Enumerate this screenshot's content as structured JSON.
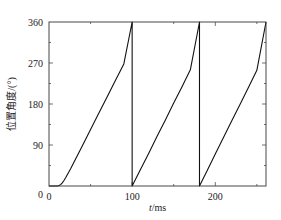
{
  "chart_data": {
    "type": "line",
    "title": "",
    "xlabel_italic": "t",
    "xlabel_unit": "/ms",
    "ylabel": "位置角度/(°)",
    "xlim": [
      0,
      261
    ],
    "ylim": [
      0,
      360
    ],
    "xticks": [
      0,
      100,
      200
    ],
    "xtick_labels": [
      "0",
      "100",
      "200"
    ],
    "x_minor_ticks": [
      50,
      150,
      250
    ],
    "yticks": [
      0,
      90,
      180,
      270,
      360
    ],
    "ytick_labels": [
      "0",
      "90",
      "180",
      "270",
      "360"
    ],
    "y_minor_ticks": [
      45,
      135,
      225,
      315
    ],
    "grid": false,
    "legend": "none",
    "series": [
      {
        "name": "position-angle",
        "color": "#111111",
        "x": [
          0,
          10,
          12,
          14,
          16,
          18,
          20,
          23,
          26,
          30,
          40,
          50,
          60,
          70,
          80,
          90,
          100,
          100,
          110,
          120,
          130,
          140,
          150,
          160,
          170,
          181,
          181,
          190,
          200,
          210,
          220,
          230,
          240,
          250,
          261
        ],
        "y": [
          0,
          0,
          1,
          3,
          7,
          12,
          18,
          28,
          38,
          52,
          88,
          124,
          160,
          196,
          232,
          268,
          360,
          0,
          36,
          72,
          109,
          145,
          182,
          218,
          255,
          360,
          0,
          33,
          70,
          107,
          144,
          180,
          217,
          254,
          360
        ]
      }
    ]
  }
}
